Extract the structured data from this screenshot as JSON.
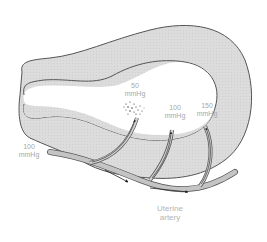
{
  "figure": {
    "colors": {
      "tissue_fill": "#d9d9d9",
      "outline": "#555555",
      "artery_fill": "#c4c4c4",
      "label_text": "#a8a8a8",
      "arrow": "#222222"
    }
  },
  "labels": {
    "inlet_pressure": {
      "value": "100",
      "unit": "mmHg"
    },
    "pressure_50": {
      "value": "50",
      "unit": "mmHg"
    },
    "pressure_100": {
      "value": "100",
      "unit": "mmHg"
    },
    "pressure_150": {
      "value": "150",
      "unit": "mmHg"
    },
    "artery": {
      "line1": "Uterine",
      "line2": "artery"
    }
  }
}
